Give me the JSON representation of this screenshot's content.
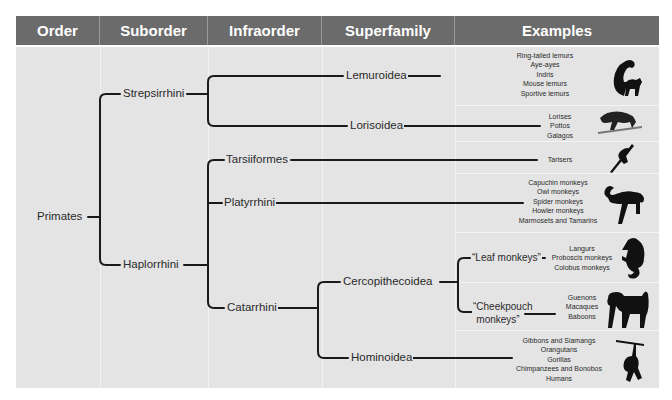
{
  "header": {
    "columns": [
      "Order",
      "Suborder",
      "Infraorder",
      "Superfamily",
      "Examples"
    ]
  },
  "colors": {
    "header_bg": "#6b6b6b",
    "header_text": "#ffffff",
    "body_bg": "#e4e4e4",
    "line": "#1a1a1a"
  },
  "tree": {
    "order": "Primates",
    "suborders": {
      "strepsirrhini": "Strepsirrhini",
      "haplorrhini": "Haplorrhini"
    },
    "infraorders": {
      "tarsiiformes": "Tarsiiformes",
      "platyrrhini": "Platyrrhini",
      "catarrhini": "Catarrhini"
    },
    "superfamilies": {
      "lemuroidea": "Lemuroidea",
      "lorisoidea": "Lorisoidea",
      "cercopithecoidea": "Cercopithecoidea",
      "hominoidea": "Hominoidea"
    },
    "subgroups": {
      "leaf": "“Leaf monkeys”",
      "cheek_line1": "“Cheekpouch",
      "cheek_line2": "monkeys”"
    }
  },
  "examples": {
    "lemuroidea": [
      "Ring-tailed lemurs",
      "Aye-ayes",
      "Indris",
      "Mouse lemurs",
      "Sportive lemurs"
    ],
    "lorisoidea": [
      "Lorises",
      "Pottos",
      "Galagos"
    ],
    "tarsiiformes": [
      "Tarisers"
    ],
    "platyrrhini": [
      "Capuchin monkeys",
      "Owl monkeys",
      "Spider monkeys",
      "Howler monkeys",
      "Marmosets and Tamarins"
    ],
    "leaf_monkeys": [
      "Langurs",
      "Proboscis monkeys",
      "Colobus monkeys"
    ],
    "cheekpouch_monkeys": [
      "Guenons",
      "Macaques",
      "Baboons"
    ],
    "hominoidea": [
      "Gibbons and Siamangs",
      "Orangutans",
      "Gorillas",
      "Chimpanzees and Bonobos",
      "Humans"
    ]
  },
  "icons": {
    "lemuroidea": "lemur-silhouette-icon",
    "lorisoidea": "loris-silhouette-icon",
    "tarsiiformes": "tarsier-silhouette-icon",
    "platyrrhini": "spider-monkey-silhouette-icon",
    "leaf_monkeys": "langur-silhouette-icon",
    "cheekpouch_monkeys": "baboon-silhouette-icon",
    "hominoidea": "gibbon-silhouette-icon"
  }
}
